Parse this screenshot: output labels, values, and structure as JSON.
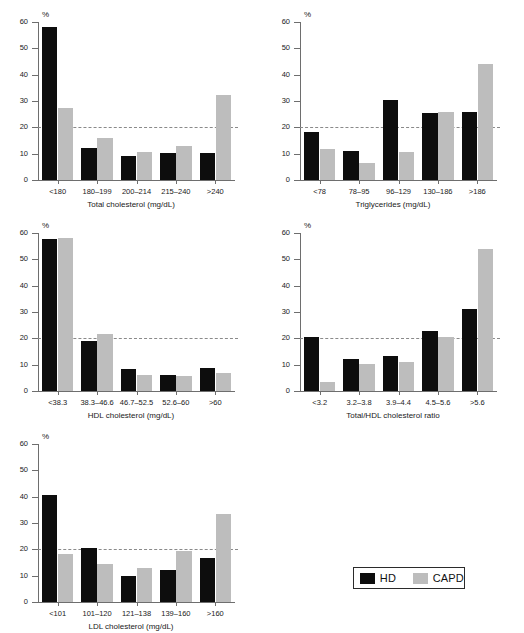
{
  "figure": {
    "series": [
      {
        "key": "hd",
        "name": "HD",
        "color": "#0d0d0d"
      },
      {
        "key": "capd",
        "name": "CAPD",
        "color": "#bdbdbd"
      }
    ],
    "y_axis": {
      "label": "%",
      "ticks": [
        "0",
        "10",
        "20",
        "30",
        "40",
        "50",
        "60"
      ],
      "min": 0,
      "max": 60
    },
    "reference_line": {
      "value": 20,
      "style": "dashed",
      "color": "#8a8a8a"
    }
  },
  "legend": {
    "hd_label": "HD",
    "capd_label": "CAPD",
    "hd_color": "#0d0d0d",
    "capd_color": "#bdbdbd"
  },
  "chart_data": [
    {
      "type": "bar",
      "id": "total-cholesterol",
      "title": "",
      "xlabel": "Total cholesterol (mg/dL)",
      "ylabel": "%",
      "ylim": [
        0,
        60
      ],
      "yticks": [
        0,
        10,
        20,
        30,
        40,
        50,
        60
      ],
      "grid": false,
      "reference_line": 20,
      "categories": [
        "<180",
        "180–199",
        "200–214",
        "215–240",
        ">240"
      ],
      "series": [
        {
          "name": "HD",
          "values": [
            58.0,
            12.3,
            9.3,
            10.3,
            10.4
          ]
        },
        {
          "name": "CAPD",
          "values": [
            27.2,
            16.0,
            10.5,
            12.8,
            32.4
          ]
        }
      ]
    },
    {
      "type": "bar",
      "id": "triglycerides",
      "title": "",
      "xlabel": "Triglycerides (mg/dL)",
      "ylabel": "%",
      "ylim": [
        0,
        60
      ],
      "yticks": [
        0,
        10,
        20,
        30,
        40,
        50,
        60
      ],
      "grid": false,
      "reference_line": 20,
      "categories": [
        "<78",
        "78–95",
        "96–129",
        "130–186",
        ">186"
      ],
      "series": [
        {
          "name": "HD",
          "values": [
            18.1,
            11.0,
            30.5,
            25.4,
            26.0
          ]
        },
        {
          "name": "CAPD",
          "values": [
            11.9,
            6.5,
            10.6,
            25.7,
            44.0
          ]
        }
      ]
    },
    {
      "type": "bar",
      "id": "hdl-cholesterol",
      "title": "",
      "xlabel": "HDL cholesterol (mg/dL)",
      "ylabel": "%",
      "ylim": [
        0,
        60
      ],
      "yticks": [
        0,
        10,
        20,
        30,
        40,
        50,
        60
      ],
      "grid": false,
      "reference_line": 20,
      "categories": [
        "<38.3",
        "38.3–46.6",
        "46.7–52.5",
        "52.6–60",
        ">60"
      ],
      "series": [
        {
          "name": "HD",
          "values": [
            57.6,
            19.1,
            8.4,
            6.0,
            8.6
          ]
        },
        {
          "name": "CAPD",
          "values": [
            58.2,
            21.8,
            6.2,
            5.7,
            7.0
          ]
        }
      ]
    },
    {
      "type": "bar",
      "id": "total-hdl-ratio",
      "title": "",
      "xlabel": "Total/HDL cholesterol ratio",
      "ylabel": "%",
      "ylim": [
        0,
        60
      ],
      "yticks": [
        0,
        10,
        20,
        30,
        40,
        50,
        60
      ],
      "grid": false,
      "reference_line": 20,
      "categories": [
        "<3.2",
        "3.2–3.8",
        "3.9–4.4",
        "4.5–5.6",
        ">5.6"
      ],
      "series": [
        {
          "name": "HD",
          "values": [
            20.5,
            12.3,
            13.2,
            22.9,
            31.1
          ]
        },
        {
          "name": "CAPD",
          "values": [
            3.3,
            10.1,
            11.2,
            20.7,
            54.0
          ]
        }
      ]
    },
    {
      "type": "bar",
      "id": "ldl-cholesterol",
      "title": "",
      "xlabel": "LDL cholesterol (mg/dL)",
      "ylabel": "%",
      "ylim": [
        0,
        60
      ],
      "yticks": [
        0,
        10,
        20,
        30,
        40,
        50,
        60
      ],
      "grid": false,
      "reference_line": 20,
      "categories": [
        "<101",
        "101–120",
        "121–138",
        "139–160",
        ">160"
      ],
      "series": [
        {
          "name": "HD",
          "values": [
            40.8,
            20.4,
            9.9,
            12.1,
            16.8
          ]
        },
        {
          "name": "CAPD",
          "values": [
            18.1,
            14.4,
            12.8,
            19.3,
            33.6
          ]
        }
      ]
    }
  ]
}
